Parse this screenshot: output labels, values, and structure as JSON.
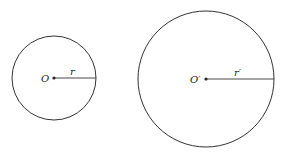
{
  "diagram": {
    "circles": [
      {
        "id": "small",
        "center": {
          "x": 54,
          "y": 78
        },
        "radius": 42,
        "center_label": "O",
        "radius_label": "r"
      },
      {
        "id": "large",
        "center": {
          "x": 206,
          "y": 79
        },
        "radius": 68,
        "center_label": "O′",
        "radius_label": "r′"
      }
    ],
    "stroke_color": "#333333"
  }
}
